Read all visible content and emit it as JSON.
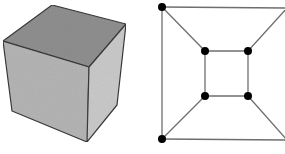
{
  "figure": {
    "panels": [
      {
        "id": "cube",
        "description": "3D shaded cube",
        "vertices": {
          "top_back": [
            52,
            5
          ],
          "top_left": [
            3,
            41
          ],
          "top_right": [
            126,
            24
          ],
          "top_front": [
            89,
            67
          ],
          "bottom_left": [
            12,
            111
          ],
          "bottom_front": [
            87,
            142
          ],
          "bottom_right": [
            117,
            105
          ]
        },
        "colors": {
          "top_face": "#8f8f8f",
          "left_face": "#b4b4b4",
          "right_face": "#c8c8c8",
          "edge": "#3a3a3a"
        }
      },
      {
        "id": "graph",
        "description": "Planar graph of a cube (Schlegel diagram)",
        "nodes": [
          {
            "id": "outer_tl",
            "x": 20,
            "y": 7,
            "visible": true
          },
          {
            "id": "outer_tr",
            "x": 145,
            "y": 8,
            "visible": false
          },
          {
            "id": "outer_bl",
            "x": 20,
            "y": 139,
            "visible": true
          },
          {
            "id": "outer_br",
            "x": 145,
            "y": 140,
            "visible": false
          },
          {
            "id": "inner_tl",
            "x": 63,
            "y": 51,
            "visible": true
          },
          {
            "id": "inner_tr",
            "x": 106,
            "y": 51,
            "visible": true
          },
          {
            "id": "inner_bl",
            "x": 63,
            "y": 96,
            "visible": true
          },
          {
            "id": "inner_br",
            "x": 106,
            "y": 96,
            "visible": true
          }
        ],
        "edges": [
          [
            "outer_tl",
            "outer_tr"
          ],
          [
            "outer_tl",
            "outer_bl"
          ],
          [
            "outer_bl",
            "outer_br"
          ],
          [
            "outer_tl",
            "inner_tl"
          ],
          [
            "outer_bl",
            "inner_bl"
          ],
          [
            "outer_tr",
            "inner_tr"
          ],
          [
            "outer_br",
            "inner_br"
          ],
          [
            "inner_tl",
            "inner_tr"
          ],
          [
            "inner_tr",
            "inner_br"
          ],
          [
            "inner_br",
            "inner_bl"
          ],
          [
            "inner_bl",
            "inner_tl"
          ]
        ],
        "colors": {
          "edge": "#6e6e6e",
          "node": "#000000"
        },
        "node_radius": 4
      }
    ]
  }
}
